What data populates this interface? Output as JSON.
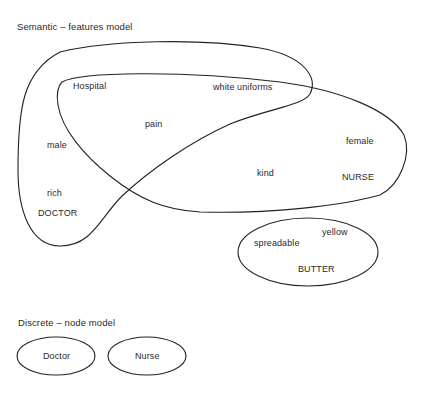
{
  "semantic_model": {
    "title": "Semantic – features model",
    "concepts": {
      "doctor": {
        "label": "DOCTOR",
        "features": [
          "male",
          "rich"
        ]
      },
      "nurse": {
        "label": "NURSE",
        "features": [
          "female",
          "kind"
        ]
      },
      "shared_features": [
        "Hospital",
        "white uniforms",
        "pain"
      ],
      "butter": {
        "label": "BUTTER",
        "features": [
          "spreadable",
          "yellow"
        ]
      }
    }
  },
  "discrete_model": {
    "title": "Discrete – node model",
    "nodes": [
      "Doctor",
      "Nurse"
    ]
  }
}
